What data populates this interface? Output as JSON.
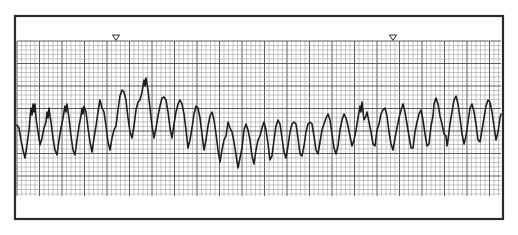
{
  "figure": {
    "markers": [
      {
        "name": "marker-1",
        "symbol": "▽",
        "x": 116
      },
      {
        "name": "marker-2",
        "symbol": "▽",
        "x": 393
      }
    ]
  },
  "layout": {
    "frame": {
      "x": 15,
      "y": 16,
      "w": 488,
      "h": 203
    },
    "grid": {
      "x": 17,
      "y": 41,
      "w": 484,
      "h": 155,
      "minor": 4.5,
      "major_every": 5
    },
    "colors": {
      "frame": "#2a2a2a",
      "grid_minor": "#8f8f8f",
      "grid_major": "#4a4a4a",
      "trace": "#1e1e1e",
      "background": "#ffffff"
    }
  },
  "waveform": {
    "points": [
      [
        17,
        125
      ],
      [
        19,
        128
      ],
      [
        21,
        140
      ],
      [
        23,
        150
      ],
      [
        25,
        158
      ],
      [
        27,
        145
      ],
      [
        29,
        130
      ],
      [
        30,
        118
      ],
      [
        31,
        108
      ],
      [
        32,
        115
      ],
      [
        33,
        104
      ],
      [
        34,
        112
      ],
      [
        35,
        104
      ],
      [
        36,
        118
      ],
      [
        38,
        132
      ],
      [
        40,
        145
      ],
      [
        42,
        138
      ],
      [
        44,
        128
      ],
      [
        46,
        122
      ],
      [
        47,
        112
      ],
      [
        48,
        118
      ],
      [
        49,
        108
      ],
      [
        50,
        116
      ],
      [
        51,
        122
      ],
      [
        53,
        138
      ],
      [
        55,
        150
      ],
      [
        57,
        155
      ],
      [
        59,
        140
      ],
      [
        61,
        128
      ],
      [
        63,
        118
      ],
      [
        65,
        106
      ],
      [
        66,
        112
      ],
      [
        67,
        104
      ],
      [
        69,
        118
      ],
      [
        71,
        136
      ],
      [
        73,
        150
      ],
      [
        75,
        155
      ],
      [
        77,
        140
      ],
      [
        79,
        126
      ],
      [
        81,
        116
      ],
      [
        82,
        108
      ],
      [
        83,
        114
      ],
      [
        84,
        106
      ],
      [
        86,
        112
      ],
      [
        88,
        128
      ],
      [
        90,
        142
      ],
      [
        92,
        152
      ],
      [
        94,
        138
      ],
      [
        96,
        126
      ],
      [
        98,
        112
      ],
      [
        100,
        100
      ],
      [
        102,
        108
      ],
      [
        104,
        112
      ],
      [
        106,
        126
      ],
      [
        108,
        142
      ],
      [
        110,
        150
      ],
      [
        112,
        138
      ],
      [
        114,
        130
      ],
      [
        116,
        126
      ],
      [
        118,
        110
      ],
      [
        120,
        96
      ],
      [
        122,
        90
      ],
      [
        124,
        92
      ],
      [
        126,
        100
      ],
      [
        128,
        118
      ],
      [
        130,
        132
      ],
      [
        132,
        138
      ],
      [
        134,
        126
      ],
      [
        136,
        110
      ],
      [
        138,
        102
      ],
      [
        140,
        100
      ],
      [
        142,
        92
      ],
      [
        144,
        80
      ],
      [
        145,
        86
      ],
      [
        146,
        78
      ],
      [
        148,
        90
      ],
      [
        150,
        108
      ],
      [
        152,
        126
      ],
      [
        154,
        138
      ],
      [
        156,
        128
      ],
      [
        158,
        116
      ],
      [
        160,
        106
      ],
      [
        162,
        98
      ],
      [
        164,
        97
      ],
      [
        166,
        100
      ],
      [
        168,
        112
      ],
      [
        170,
        128
      ],
      [
        172,
        138
      ],
      [
        174,
        124
      ],
      [
        176,
        112
      ],
      [
        178,
        104
      ],
      [
        180,
        100
      ],
      [
        182,
        104
      ],
      [
        184,
        114
      ],
      [
        186,
        130
      ],
      [
        188,
        148
      ],
      [
        190,
        140
      ],
      [
        192,
        128
      ],
      [
        194,
        114
      ],
      [
        196,
        106
      ],
      [
        198,
        108
      ],
      [
        200,
        118
      ],
      [
        202,
        134
      ],
      [
        204,
        150
      ],
      [
        206,
        140
      ],
      [
        208,
        126
      ],
      [
        210,
        116
      ],
      [
        212,
        112
      ],
      [
        214,
        120
      ],
      [
        216,
        134
      ],
      [
        218,
        150
      ],
      [
        220,
        162
      ],
      [
        222,
        150
      ],
      [
        224,
        140
      ],
      [
        226,
        136
      ],
      [
        228,
        122
      ],
      [
        230,
        128
      ],
      [
        232,
        132
      ],
      [
        234,
        142
      ],
      [
        236,
        155
      ],
      [
        238,
        168
      ],
      [
        240,
        158
      ],
      [
        242,
        148
      ],
      [
        244,
        130
      ],
      [
        246,
        124
      ],
      [
        248,
        130
      ],
      [
        250,
        140
      ],
      [
        252,
        156
      ],
      [
        254,
        164
      ],
      [
        256,
        150
      ],
      [
        258,
        140
      ],
      [
        260,
        136
      ],
      [
        262,
        128
      ],
      [
        264,
        122
      ],
      [
        266,
        130
      ],
      [
        268,
        144
      ],
      [
        270,
        160
      ],
      [
        272,
        156
      ],
      [
        274,
        140
      ],
      [
        276,
        126
      ],
      [
        278,
        120
      ],
      [
        280,
        124
      ],
      [
        282,
        138
      ],
      [
        284,
        152
      ],
      [
        286,
        158
      ],
      [
        288,
        146
      ],
      [
        290,
        132
      ],
      [
        292,
        124
      ],
      [
        294,
        122
      ],
      [
        296,
        124
      ],
      [
        298,
        138
      ],
      [
        300,
        154
      ],
      [
        302,
        156
      ],
      [
        304,
        146
      ],
      [
        306,
        132
      ],
      [
        308,
        124
      ],
      [
        310,
        122
      ],
      [
        312,
        124
      ],
      [
        314,
        136
      ],
      [
        316,
        150
      ],
      [
        318,
        154
      ],
      [
        320,
        142
      ],
      [
        322,
        130
      ],
      [
        324,
        124
      ],
      [
        326,
        118
      ],
      [
        328,
        114
      ],
      [
        330,
        120
      ],
      [
        332,
        134
      ],
      [
        334,
        148
      ],
      [
        336,
        154
      ],
      [
        338,
        146
      ],
      [
        340,
        130
      ],
      [
        342,
        120
      ],
      [
        344,
        114
      ],
      [
        346,
        118
      ],
      [
        348,
        126
      ],
      [
        350,
        136
      ],
      [
        352,
        146
      ],
      [
        354,
        140
      ],
      [
        356,
        130
      ],
      [
        358,
        118
      ],
      [
        360,
        106
      ],
      [
        361,
        112
      ],
      [
        362,
        102
      ],
      [
        364,
        120
      ],
      [
        366,
        116
      ],
      [
        367,
        112
      ],
      [
        369,
        122
      ],
      [
        371,
        132
      ],
      [
        373,
        144
      ],
      [
        375,
        146
      ],
      [
        377,
        130
      ],
      [
        379,
        124
      ],
      [
        381,
        114
      ],
      [
        383,
        110
      ],
      [
        385,
        108
      ],
      [
        387,
        116
      ],
      [
        389,
        132
      ],
      [
        391,
        144
      ],
      [
        393,
        150
      ],
      [
        395,
        138
      ],
      [
        397,
        128
      ],
      [
        399,
        118
      ],
      [
        401,
        110
      ],
      [
        403,
        104
      ],
      [
        405,
        112
      ],
      [
        407,
        124
      ],
      [
        409,
        136
      ],
      [
        411,
        148
      ],
      [
        413,
        148
      ],
      [
        415,
        132
      ],
      [
        417,
        122
      ],
      [
        419,
        114
      ],
      [
        421,
        110
      ],
      [
        423,
        120
      ],
      [
        425,
        134
      ],
      [
        427,
        146
      ],
      [
        429,
        144
      ],
      [
        431,
        126
      ],
      [
        433,
        116
      ],
      [
        434,
        104
      ],
      [
        436,
        98
      ],
      [
        438,
        104
      ],
      [
        440,
        116
      ],
      [
        442,
        124
      ],
      [
        444,
        134
      ],
      [
        446,
        136
      ],
      [
        447,
        146
      ],
      [
        448,
        140
      ],
      [
        450,
        124
      ],
      [
        452,
        112
      ],
      [
        454,
        100
      ],
      [
        456,
        96
      ],
      [
        458,
        104
      ],
      [
        460,
        118
      ],
      [
        462,
        134
      ],
      [
        464,
        144
      ],
      [
        466,
        136
      ],
      [
        468,
        122
      ],
      [
        470,
        108
      ],
      [
        472,
        104
      ],
      [
        474,
        112
      ],
      [
        476,
        124
      ],
      [
        478,
        140
      ],
      [
        480,
        142
      ],
      [
        482,
        130
      ],
      [
        484,
        118
      ],
      [
        486,
        106
      ],
      [
        488,
        100
      ],
      [
        490,
        102
      ],
      [
        492,
        112
      ],
      [
        494,
        126
      ],
      [
        496,
        140
      ],
      [
        498,
        132
      ],
      [
        500,
        118
      ],
      [
        501,
        114
      ]
    ]
  }
}
